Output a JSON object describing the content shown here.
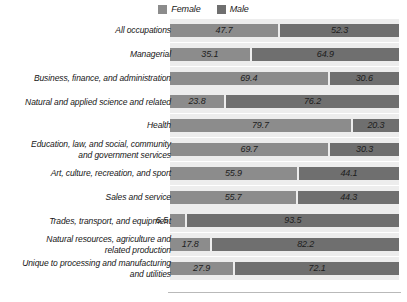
{
  "legend": {
    "items": [
      {
        "label": "Female",
        "color": "#8c8c8c",
        "icon": "legend-swatch-female"
      },
      {
        "label": "Male",
        "color": "#6f6f6f",
        "icon": "legend-swatch-male"
      }
    ]
  },
  "chart_data": {
    "type": "bar",
    "subtype": "stacked-horizontal-100-percent",
    "title": "",
    "subtitle": "",
    "xlabel": "",
    "ylabel": "",
    "xlim": [
      0,
      100
    ],
    "grid": false,
    "legend_position": "top-center",
    "value_unit": "percent",
    "categories": [
      "All occupations",
      "Managerial",
      "Business, finance, and administration",
      "Natural and applied science and related",
      "Health",
      "Education, law, and social, community and government services",
      "Art, culture, recreation, and sport",
      "Sales and service",
      "Trades, transport, and equipment",
      "Natural resources, agriculture and related production",
      "Unique to processing and manufacturing and utilities"
    ],
    "series": [
      {
        "name": "Female",
        "color": "#8c8c8c",
        "values": [
          47.7,
          35.1,
          69.4,
          23.8,
          79.7,
          69.7,
          55.9,
          55.7,
          6.5,
          17.8,
          27.9
        ]
      },
      {
        "name": "Male",
        "color": "#6f6f6f",
        "values": [
          52.3,
          64.9,
          30.6,
          76.2,
          20.3,
          30.3,
          44.1,
          44.3,
          93.5,
          82.2,
          72.1
        ]
      }
    ]
  },
  "rows": [
    {
      "label_lines": [
        "All occupations"
      ],
      "female": "47.7",
      "male": "52.3",
      "female_pct": 47.7,
      "male_pct": 52.3,
      "female_label_outside": false
    },
    {
      "label_lines": [
        "Managerial"
      ],
      "female": "35.1",
      "male": "64.9",
      "female_pct": 35.1,
      "male_pct": 64.9,
      "female_label_outside": false
    },
    {
      "label_lines": [
        "Business, finance, and administration"
      ],
      "female": "69.4",
      "male": "30.6",
      "female_pct": 69.4,
      "male_pct": 30.6,
      "female_label_outside": false
    },
    {
      "label_lines": [
        "Natural and applied science and related"
      ],
      "female": "23.8",
      "male": "76.2",
      "female_pct": 23.8,
      "male_pct": 76.2,
      "female_label_outside": false
    },
    {
      "label_lines": [
        "Health"
      ],
      "female": "79.7",
      "male": "20.3",
      "female_pct": 79.7,
      "male_pct": 20.3,
      "female_label_outside": false
    },
    {
      "label_lines": [
        "Education, law, and social, community",
        "and government services"
      ],
      "female": "69.7",
      "male": "30.3",
      "female_pct": 69.7,
      "male_pct": 30.3,
      "female_label_outside": false
    },
    {
      "label_lines": [
        "Art, culture, recreation, and sport"
      ],
      "female": "55.9",
      "male": "44.1",
      "female_pct": 55.9,
      "male_pct": 44.1,
      "female_label_outside": false
    },
    {
      "label_lines": [
        "Sales and service"
      ],
      "female": "55.7",
      "male": "44.3",
      "female_pct": 55.7,
      "male_pct": 44.3,
      "female_label_outside": false
    },
    {
      "label_lines": [
        "Trades, transport, and equipment"
      ],
      "female": "6.5",
      "male": "93.5",
      "female_pct": 6.5,
      "male_pct": 93.5,
      "female_label_outside": true
    },
    {
      "label_lines": [
        "Natural resources, agriculture and",
        "related production"
      ],
      "female": "17.8",
      "male": "82.2",
      "female_pct": 17.8,
      "male_pct": 82.2,
      "female_label_outside": false
    },
    {
      "label_lines": [
        "Unique to processing and manufacturing",
        "and utilities"
      ],
      "female": "27.9",
      "male": "72.1",
      "female_pct": 27.9,
      "male_pct": 72.1,
      "female_label_outside": false
    }
  ],
  "layout": {
    "plot_left": 170,
    "plot_top": 19,
    "plot_width": 229,
    "band_height": 23,
    "bar_height": 13,
    "row_pitch": 23.8
  },
  "colors": {
    "female": "#8c8c8c",
    "male": "#6f6f6f",
    "band": "#ededed",
    "axis": "#b9b9b9",
    "text": "#161616"
  }
}
